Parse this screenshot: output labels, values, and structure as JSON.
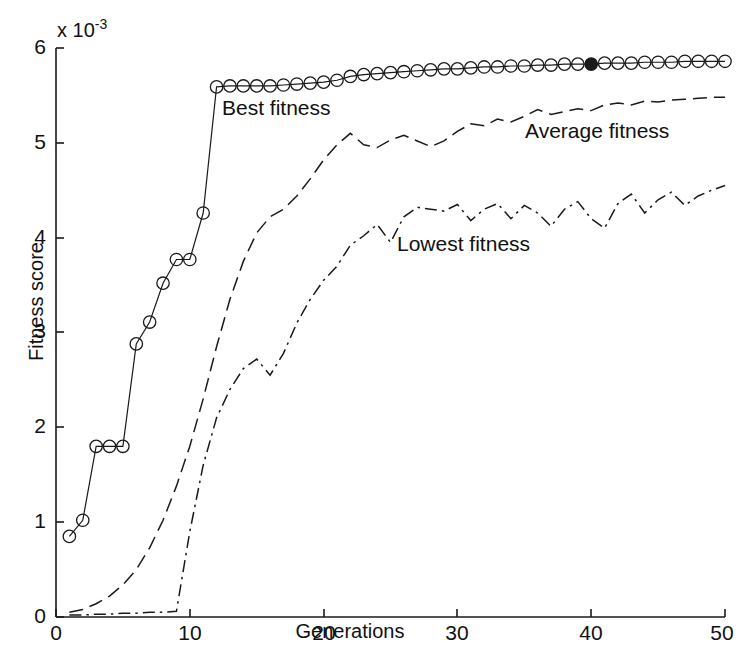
{
  "chart_data": {
    "type": "line",
    "title": "",
    "xlabel": "Generations",
    "ylabel": "Fitness score",
    "y_multiplier": "x 10",
    "y_multiplier_exponent": "-3",
    "xlim": [
      0,
      50
    ],
    "ylim": [
      0,
      6
    ],
    "x_ticks": [
      0,
      10,
      20,
      30,
      40,
      50
    ],
    "y_ticks": [
      0,
      1,
      2,
      3,
      4,
      5,
      6
    ],
    "grid": false,
    "legend_position": "inline-annotations",
    "x": [
      1,
      2,
      3,
      4,
      5,
      6,
      7,
      8,
      9,
      10,
      11,
      12,
      13,
      14,
      15,
      16,
      17,
      18,
      19,
      20,
      21,
      22,
      23,
      24,
      25,
      26,
      27,
      28,
      29,
      30,
      31,
      32,
      33,
      34,
      35,
      36,
      37,
      38,
      39,
      40,
      41,
      42,
      43,
      44,
      45,
      46,
      47,
      48,
      49,
      50
    ],
    "series": [
      {
        "name": "Best fitness",
        "style": "solid-with-circle-markers",
        "marker": "circle",
        "color": "#1a1a1a",
        "highlight_index": 39,
        "highlight_marker": "filled-circle",
        "values": [
          0.85,
          1.02,
          1.8,
          1.8,
          1.8,
          2.88,
          3.11,
          3.52,
          3.77,
          3.77,
          4.26,
          5.59,
          5.6,
          5.6,
          5.6,
          5.6,
          5.61,
          5.62,
          5.63,
          5.64,
          5.66,
          5.7,
          5.72,
          5.73,
          5.74,
          5.75,
          5.76,
          5.77,
          5.78,
          5.78,
          5.79,
          5.8,
          5.8,
          5.81,
          5.81,
          5.82,
          5.82,
          5.83,
          5.83,
          5.83,
          5.84,
          5.84,
          5.84,
          5.85,
          5.85,
          5.85,
          5.86,
          5.86,
          5.86,
          5.86
        ]
      },
      {
        "name": "Average fitness",
        "style": "dashed",
        "marker": "none",
        "color": "#1a1a1a",
        "values": [
          0.05,
          0.08,
          0.14,
          0.22,
          0.34,
          0.5,
          0.73,
          1.02,
          1.38,
          1.8,
          2.3,
          2.85,
          3.35,
          3.75,
          4.05,
          4.22,
          4.3,
          4.44,
          4.62,
          4.82,
          4.98,
          5.1,
          4.98,
          4.95,
          5.03,
          5.08,
          5.02,
          4.96,
          5.02,
          5.12,
          5.2,
          5.18,
          5.25,
          5.22,
          5.28,
          5.35,
          5.3,
          5.33,
          5.36,
          5.34,
          5.4,
          5.42,
          5.4,
          5.44,
          5.43,
          5.45,
          5.46,
          5.47,
          5.48,
          5.48
        ]
      },
      {
        "name": "Lowest fitness",
        "style": "dash-dot",
        "marker": "none",
        "color": "#1a1a1a",
        "values": [
          0.02,
          0.02,
          0.03,
          0.03,
          0.04,
          0.04,
          0.05,
          0.05,
          0.06,
          0.9,
          1.6,
          2.1,
          2.4,
          2.62,
          2.72,
          2.55,
          2.78,
          3.1,
          3.35,
          3.55,
          3.7,
          3.92,
          4.02,
          4.14,
          3.95,
          4.22,
          4.32,
          4.3,
          4.28,
          4.35,
          4.18,
          4.3,
          4.36,
          4.2,
          4.34,
          4.26,
          4.12,
          4.3,
          4.38,
          4.2,
          4.1,
          4.36,
          4.46,
          4.26,
          4.4,
          4.48,
          4.34,
          4.44,
          4.5,
          4.55
        ]
      }
    ],
    "annotations": [
      {
        "name": "best-fitness-label",
        "text": "Best fitness"
      },
      {
        "name": "average-fitness-label",
        "text": "Average fitness"
      },
      {
        "name": "lowest-fitness-label",
        "text": "Lowest fitness"
      }
    ]
  },
  "axes": {
    "x_title": "Generations",
    "y_title": "Fitness score",
    "y_exponent_prefix": "x 10",
    "y_exponent_power": "-3",
    "x_tick_labels": [
      "0",
      "10",
      "20",
      "30",
      "40",
      "50"
    ],
    "y_tick_labels": [
      "0",
      "1",
      "2",
      "3",
      "4",
      "5",
      "6"
    ]
  },
  "colors": {
    "background": "#ffffff",
    "axis": "#1a1a1a",
    "line": "#1a1a1a",
    "text": "#111111"
  }
}
